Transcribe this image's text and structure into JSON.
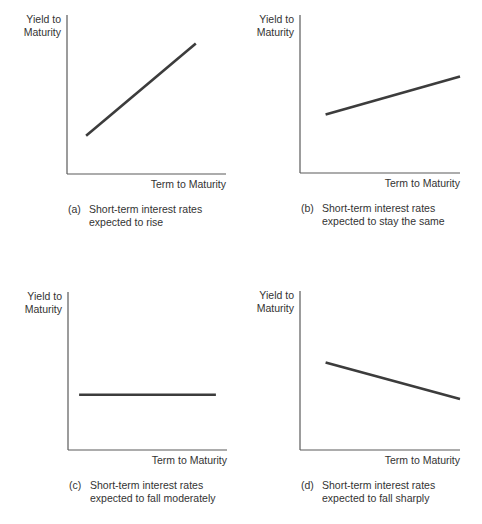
{
  "chart_data": [
    {
      "type": "line",
      "id": "a",
      "title": "",
      "xlabel": "Term to Maturity",
      "ylabel": "Yield to\nMaturity",
      "ylabel_lines": [
        "Yield to",
        "Maturity"
      ],
      "caption_tag": "(a)",
      "caption_lines": [
        "Short-term interest rates",
        "expected to rise"
      ],
      "xlim": [
        0,
        1
      ],
      "ylim": [
        0,
        1
      ],
      "grid": false,
      "ticks": false,
      "series": [
        {
          "name": "yield curve",
          "x": [
            0.12,
            0.81
          ],
          "y": [
            0.24,
            0.82
          ]
        }
      ]
    },
    {
      "type": "line",
      "id": "b",
      "title": "",
      "xlabel": "Term to Maturity",
      "ylabel": "Yield to\nMaturity",
      "ylabel_lines": [
        "Yield to",
        "Maturity"
      ],
      "caption_tag": "(b)",
      "caption_lines": [
        "Short-term interest rates",
        "expected to stay the same"
      ],
      "xlim": [
        0,
        1
      ],
      "ylim": [
        0,
        1
      ],
      "grid": false,
      "ticks": false,
      "series": [
        {
          "name": "yield curve",
          "x": [
            0.16,
            1.0
          ],
          "y": [
            0.37,
            0.61
          ]
        }
      ]
    },
    {
      "type": "line",
      "id": "c",
      "title": "",
      "xlabel": "Term to Maturity",
      "ylabel": "Yield to\nMaturity",
      "ylabel_lines": [
        "Yield to",
        "Maturity"
      ],
      "caption_tag": "(c)",
      "caption_lines": [
        "Short-term interest rates",
        "expected to fall moderately"
      ],
      "xlim": [
        0,
        1
      ],
      "ylim": [
        0,
        1
      ],
      "grid": false,
      "ticks": false,
      "series": [
        {
          "name": "yield curve",
          "x": [
            0.07,
            0.93
          ],
          "y": [
            0.35,
            0.35
          ]
        }
      ]
    },
    {
      "type": "line",
      "id": "d",
      "title": "",
      "xlabel": "Term to Maturity",
      "ylabel": "Yield to\nMaturity",
      "ylabel_lines": [
        "Yield to",
        "Maturity"
      ],
      "caption_tag": "(d)",
      "caption_lines": [
        "Short-term interest rates",
        "expected to fall sharply"
      ],
      "xlim": [
        0,
        1
      ],
      "ylim": [
        0,
        1
      ],
      "grid": false,
      "ticks": false,
      "series": [
        {
          "name": "yield curve",
          "x": [
            0.16,
            1.0
          ],
          "y": [
            0.55,
            0.32
          ]
        }
      ]
    }
  ],
  "colors": {
    "axis": "#5a5a5a",
    "line": "#3c3c3c",
    "text": "#333333"
  }
}
